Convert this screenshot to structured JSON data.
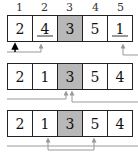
{
  "indices": [
    "1",
    "2",
    "3",
    "4",
    "5"
  ],
  "rows": [
    {
      "values": [
        "2",
        "4",
        "3",
        "5",
        "1"
      ],
      "highlight_index": 2,
      "underlined": [
        1,
        4
      ]
    },
    {
      "values": [
        "2",
        "1",
        "3",
        "5",
        "4"
      ],
      "highlight_index": 2,
      "underlined": []
    },
    {
      "values": [
        "2",
        "1",
        "3",
        "5",
        "4"
      ],
      "highlight_index": 2,
      "underlined": []
    }
  ],
  "colors": {
    "highlight": "#b8b8b8",
    "arrow": "#999999",
    "pointer": "#000000"
  }
}
